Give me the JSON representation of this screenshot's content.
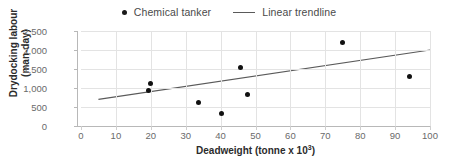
{
  "chart_data": {
    "type": "scatter",
    "title": "",
    "xlabel": "Deadweight (tonne x 10³)",
    "xlabel_base": "Deadweight (tonne x 10",
    "xlabel_exp": "3",
    "xlabel_tail": ")",
    "ylabel_line1": "Drydocking labour",
    "ylabel_line2": "(man-day)",
    "ylabel": "Drydocking labour (man-day)",
    "xlim": [
      0,
      100
    ],
    "ylim": [
      0,
      2500
    ],
    "grid": true,
    "legend_position": "top-center",
    "xticks": [
      0,
      10,
      20,
      30,
      40,
      50,
      60,
      70,
      80,
      90,
      100
    ],
    "xtick_labels": [
      "0",
      "10",
      "20",
      "30",
      "40",
      "50",
      "60",
      "70",
      "80",
      "90",
      "100"
    ],
    "yticks": [
      0,
      500,
      1000,
      1500,
      2000,
      2500
    ],
    "ytick_labels": [
      "0",
      "500",
      "1,000",
      "1,500",
      "2,000",
      "2,500"
    ],
    "series": [
      {
        "name": "Chemical tanker",
        "type": "scatter",
        "marker": "circle",
        "color": "#111111",
        "points": [
          {
            "x": 19.2,
            "y": 940
          },
          {
            "x": 19.8,
            "y": 1120
          },
          {
            "x": 33.8,
            "y": 620
          },
          {
            "x": 40.2,
            "y": 320
          },
          {
            "x": 45.6,
            "y": 1550
          },
          {
            "x": 47.6,
            "y": 820
          },
          {
            "x": 75.0,
            "y": 2200
          },
          {
            "x": 94.2,
            "y": 1290
          }
        ]
      },
      {
        "name": "Linear trendline",
        "type": "line",
        "color": "#5a5a5a",
        "endpoints": [
          {
            "x": 5,
            "y": 700
          },
          {
            "x": 100,
            "y": 2000
          }
        ]
      }
    ]
  },
  "legend": {
    "items": [
      {
        "label": "Chemical tanker",
        "marker": "dot",
        "color": "#111111"
      },
      {
        "label": "Linear trendline",
        "marker": "line",
        "color": "#5a5a5a"
      }
    ]
  },
  "axes": {
    "x_title_base": "Deadweight (tonne x 10",
    "x_title_exp": "3",
    "x_title_tail": ")",
    "y_title_line1": "Drydocking labour",
    "y_title_line2": "(man-day)"
  },
  "colors": {
    "marker": "#111111",
    "trendline": "#5a5a5a",
    "grid": "#e3e3e3",
    "axis": "#b8b8b8",
    "tick_text": "#6a6a6a",
    "title_text": "#2b2b2b",
    "legend_text": "#4a4a4a",
    "background": "#ffffff"
  }
}
